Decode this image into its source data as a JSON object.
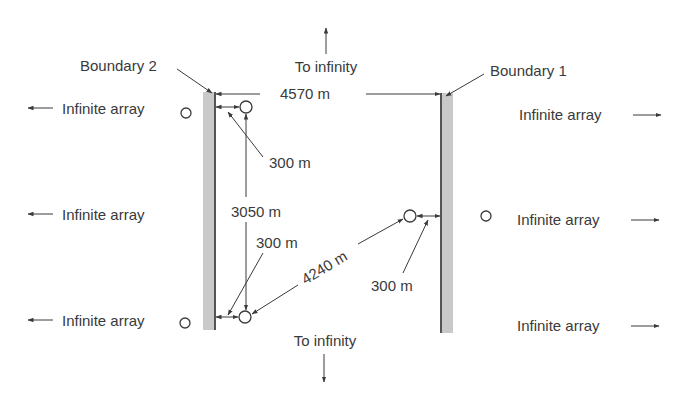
{
  "diagram": {
    "boundaries": [
      {
        "label": "Boundary 2",
        "side": "left"
      },
      {
        "label": "Boundary 1",
        "side": "right"
      }
    ],
    "dimensions": {
      "boundary_spacing": "4570 m",
      "well_offset_upper_left": "300 m",
      "vertical_spacing": "3050 m",
      "well_offset_lower_left": "300 m",
      "diagonal_spacing": "4240 m",
      "well_offset_right": "300 m"
    },
    "directions": {
      "top": "To infinity",
      "bottom": "To infinity"
    },
    "arrays": {
      "left_top": "Infinite array",
      "left_middle": "Infinite array",
      "left_bottom": "Infinite array",
      "right_top": "Infinite array",
      "right_middle": "Infinite array",
      "right_bottom": "Infinite array"
    },
    "colors": {
      "ink": "#3a3a3a",
      "boundary_fill": "#c9c9c9"
    }
  }
}
